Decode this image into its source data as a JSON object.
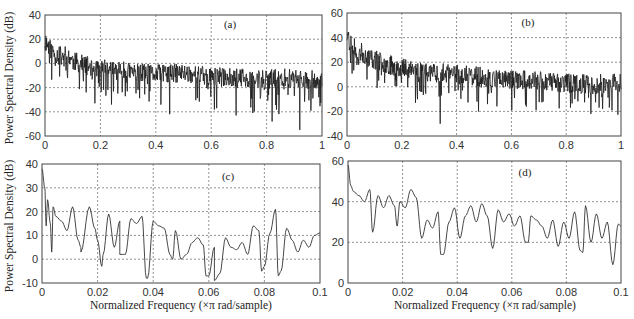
{
  "figure": {
    "ylabel_top": "Power Spectral Density (dB)",
    "ylabel_bottom": "Power Spectral Density (dB)",
    "xlabel_c": "Normalized Frequency  (×π rad/sample)",
    "xlabel_d": "Normalized Frequency  (×π rad/sample)"
  },
  "chart_data": [
    {
      "id": "a",
      "type": "line",
      "title": "(a)",
      "xlabel": "",
      "ylabel": "Power Spectral Density (dB)",
      "xlim": [
        0,
        1
      ],
      "ylim": [
        -60,
        40
      ],
      "xticks": [
        0,
        0.2,
        0.4,
        0.6,
        0.8,
        1
      ],
      "xtick_labels": [
        "0",
        "0.2",
        "0.4",
        "0.6",
        "0.8",
        "1"
      ],
      "yticks": [
        -60,
        -40,
        -20,
        0,
        20,
        40
      ],
      "ytick_labels": [
        "-60",
        "-40",
        "-20",
        "0",
        "20",
        "40"
      ],
      "grid": true,
      "noisy": true,
      "envelope_x": [
        0,
        0.02,
        0.05,
        0.08,
        0.1,
        0.15,
        0.2,
        0.3,
        0.4,
        0.5,
        0.6,
        0.7,
        0.8,
        0.9,
        1.0
      ],
      "envelope_y": [
        18,
        12,
        6,
        8,
        2,
        -2,
        -4,
        -7,
        -9,
        -8,
        -11,
        -12,
        -13,
        -12,
        -14
      ],
      "deep_dips": [
        [
          0.18,
          -33
        ],
        [
          0.24,
          -34
        ],
        [
          0.45,
          -42
        ],
        [
          0.62,
          -37
        ],
        [
          0.69,
          -43
        ],
        [
          0.82,
          -48
        ],
        [
          0.92,
          -55
        ]
      ],
      "points": 700,
      "seed": 11
    },
    {
      "id": "b",
      "type": "line",
      "title": "(b)",
      "xlabel": "",
      "ylabel": "",
      "xlim": [
        0,
        1
      ],
      "ylim": [
        -40,
        60
      ],
      "xticks": [
        0,
        0.2,
        0.4,
        0.6,
        0.8,
        1
      ],
      "xtick_labels": [
        "0",
        "0.2",
        "0.4",
        "0.6",
        "0.8",
        "1"
      ],
      "yticks": [
        -40,
        -20,
        0,
        20,
        40,
        60
      ],
      "ytick_labels": [
        "-40",
        "-20",
        "0",
        "20",
        "40",
        "60"
      ],
      "grid": true,
      "noisy": true,
      "envelope_x": [
        0,
        0.02,
        0.05,
        0.1,
        0.15,
        0.2,
        0.3,
        0.4,
        0.5,
        0.6,
        0.7,
        0.8,
        0.9,
        1.0
      ],
      "envelope_y": [
        40,
        33,
        28,
        22,
        18,
        16,
        12,
        10,
        8,
        6,
        5,
        3,
        2,
        4
      ],
      "deep_dips": [
        [
          0.34,
          -30
        ],
        [
          0.48,
          -20
        ],
        [
          0.25,
          -13
        ],
        [
          0.69,
          -19
        ],
        [
          0.89,
          -22
        ]
      ],
      "points": 700,
      "seed": 23
    },
    {
      "id": "c",
      "type": "line",
      "title": "(c)",
      "xlabel": "Normalized Frequency  (×π rad/sample)",
      "ylabel": "Power Spectral Density (dB)",
      "xlim": [
        0,
        0.1
      ],
      "ylim": [
        -10,
        40
      ],
      "xticks": [
        0,
        0.02,
        0.04,
        0.06,
        0.08,
        0.1
      ],
      "xtick_labels": [
        "0",
        "0.02",
        "0.04",
        "0.06",
        "0.08",
        "0.1"
      ],
      "yticks": [
        -10,
        0,
        10,
        20,
        30,
        40
      ],
      "ytick_labels": [
        "-10",
        "0",
        "10",
        "20",
        "30",
        "40"
      ],
      "grid": true,
      "noisy": false,
      "x": [
        0,
        0.001,
        0.002,
        0.003,
        0.004,
        0.005,
        0.007,
        0.009,
        0.011,
        0.013,
        0.014,
        0.017,
        0.019,
        0.02,
        0.022,
        0.024,
        0.026,
        0.028,
        0.03,
        0.032,
        0.034,
        0.036,
        0.038,
        0.04,
        0.042,
        0.044,
        0.046,
        0.048,
        0.05,
        0.052,
        0.054,
        0.056,
        0.058,
        0.06,
        0.062,
        0.064,
        0.066,
        0.068,
        0.07,
        0.072,
        0.074,
        0.076,
        0.078,
        0.08,
        0.082,
        0.084,
        0.086,
        0.088,
        0.09,
        0.092,
        0.094,
        0.096,
        0.098,
        0.1
      ],
      "y": [
        38,
        30,
        25,
        15,
        22,
        18,
        16,
        12,
        22,
        8,
        5,
        22,
        13,
        8,
        2,
        19,
        5,
        16,
        2,
        17,
        15,
        18,
        -8,
        16,
        14,
        13,
        2,
        12,
        0,
        2,
        7,
        9,
        6,
        -7,
        5,
        -6,
        9,
        5,
        4,
        7,
        2,
        14,
        12,
        -3,
        11,
        21,
        -5,
        13,
        8,
        3,
        8,
        5,
        10,
        11
      ],
      "dips": [
        [
          0.0015,
          14
        ],
        [
          0.0035,
          3
        ],
        [
          0.014,
          3
        ],
        [
          0.0215,
          -3
        ],
        [
          0.028,
          2
        ],
        [
          0.0375,
          -8
        ],
        [
          0.047,
          0
        ],
        [
          0.059,
          -7
        ],
        [
          0.062,
          -9
        ],
        [
          0.079,
          -5
        ],
        [
          0.085,
          -7
        ]
      ]
    },
    {
      "id": "d",
      "type": "line",
      "title": "(d)",
      "xlabel": "Normalized Frequency  (×π rad/sample)",
      "ylabel": "",
      "xlim": [
        0,
        0.1
      ],
      "ylim": [
        0,
        60
      ],
      "xticks": [
        0,
        0.02,
        0.04,
        0.06,
        0.08,
        0.1
      ],
      "xtick_labels": [
        "0",
        "0.02",
        "0.04",
        "0.06",
        "0.08",
        "0.1"
      ],
      "yticks": [
        0,
        20,
        40,
        60
      ],
      "ytick_labels": [
        "0",
        "20",
        "40",
        "60"
      ],
      "grid": true,
      "noisy": false,
      "x": [
        0,
        0.001,
        0.002,
        0.004,
        0.006,
        0.008,
        0.009,
        0.011,
        0.013,
        0.015,
        0.017,
        0.019,
        0.021,
        0.023,
        0.025,
        0.027,
        0.029,
        0.031,
        0.033,
        0.035,
        0.037,
        0.039,
        0.041,
        0.043,
        0.045,
        0.047,
        0.049,
        0.051,
        0.053,
        0.055,
        0.057,
        0.059,
        0.061,
        0.063,
        0.065,
        0.067,
        0.069,
        0.071,
        0.073,
        0.075,
        0.077,
        0.079,
        0.081,
        0.083,
        0.085,
        0.087,
        0.089,
        0.091,
        0.093,
        0.095,
        0.097,
        0.099,
        0.1
      ],
      "y": [
        58,
        48,
        45,
        43,
        40,
        46,
        25,
        43,
        37,
        43,
        38,
        40,
        37,
        46,
        42,
        22,
        31,
        27,
        35,
        14,
        30,
        37,
        22,
        33,
        38,
        30,
        39,
        33,
        17,
        36,
        30,
        34,
        28,
        33,
        20,
        33,
        31,
        28,
        22,
        31,
        18,
        30,
        22,
        35,
        16,
        38,
        20,
        34,
        22,
        30,
        9,
        29,
        28
      ],
      "dips": [
        [
          0.009,
          25
        ],
        [
          0.018,
          28
        ],
        [
          0.027,
          22
        ],
        [
          0.034,
          14
        ],
        [
          0.053,
          17
        ],
        [
          0.066,
          20
        ],
        [
          0.077,
          18
        ],
        [
          0.086,
          15
        ],
        [
          0.097,
          9
        ]
      ]
    }
  ],
  "panels_layout": [
    {
      "id": "a",
      "x0": 45,
      "x1": 322,
      "y0": 15,
      "y1": 136,
      "title_x": 230,
      "title_y": 28
    },
    {
      "id": "b",
      "x0": 347,
      "x1": 621,
      "y0": 13,
      "y1": 136,
      "title_x": 528,
      "title_y": 26
    },
    {
      "id": "c",
      "x0": 42,
      "x1": 320,
      "y0": 164,
      "y1": 283,
      "title_x": 228,
      "title_y": 180
    },
    {
      "id": "d",
      "x0": 348,
      "x1": 621,
      "y0": 161,
      "y1": 283,
      "title_x": 525,
      "title_y": 176
    }
  ]
}
